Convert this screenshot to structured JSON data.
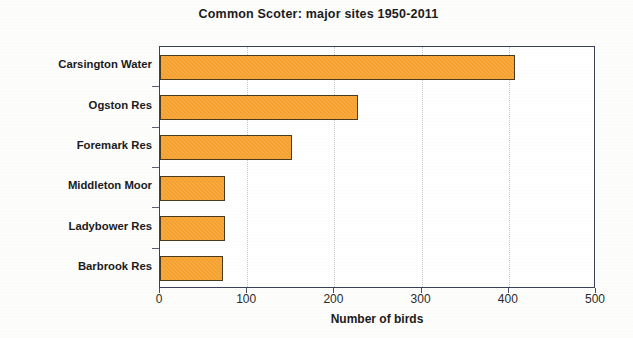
{
  "chart_data": {
    "type": "bar",
    "orientation": "horizontal",
    "title": "Common Scoter: major sites 1950-2011",
    "xlabel": "Number of birds",
    "ylabel": "",
    "categories": [
      "Carsington Water",
      "Ogston Res",
      "Foremark Res",
      "Middleton Moor",
      "Ladybower Res",
      "Barbrook Res"
    ],
    "values": [
      407,
      227,
      151,
      75,
      75,
      72
    ],
    "xlim": [
      0,
      500
    ],
    "xticks": [
      0,
      100,
      200,
      300,
      400,
      500
    ],
    "xtick_labels": [
      "0",
      "100",
      "200",
      "300",
      "400",
      "500"
    ],
    "grid": "vertical-dotted",
    "legend": "none",
    "series": [
      {
        "name": "Number of birds",
        "values": [
          407,
          227,
          151,
          75,
          75,
          72
        ]
      }
    ],
    "colors": {
      "bar_fill": "#f7a02c",
      "bar_outline": "#4a3a20",
      "axis": "#3c3f5a",
      "gridline": "#c8c8c8",
      "text": "#1b1b1b",
      "plot_background": "#ffffff",
      "page_background": "#fdfdfb"
    }
  }
}
